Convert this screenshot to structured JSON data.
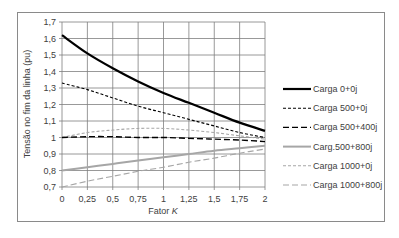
{
  "chart_data": {
    "type": "line",
    "title": "",
    "xlabel": "Fator K",
    "ylabel": "Tensão no fim da linha (pu)",
    "xlim": [
      0,
      2
    ],
    "ylim": [
      0.7,
      1.7
    ],
    "grid": true,
    "legend_position": "right",
    "x_ticks": [
      "0",
      "0,25",
      "0,5",
      "0,75",
      "1",
      "1,25",
      "1,5",
      "1,75",
      "2"
    ],
    "y_ticks": [
      "0,7",
      "0,8",
      "0,9",
      "1",
      "1,1",
      "1,2",
      "1,3",
      "1,4",
      "1,5",
      "1,6",
      "1,7"
    ],
    "x": [
      0,
      0.25,
      0.5,
      0.75,
      1,
      1.25,
      1.5,
      1.75,
      2
    ],
    "series": [
      {
        "name": "Carga 0+0j",
        "values": [
          1.62,
          1.51,
          1.42,
          1.34,
          1.27,
          1.21,
          1.15,
          1.09,
          1.04
        ],
        "color": "#000000",
        "width": 2.2,
        "dash": ""
      },
      {
        "name": "Carga 500+0j",
        "values": [
          1.33,
          1.29,
          1.24,
          1.19,
          1.15,
          1.11,
          1.07,
          1.03,
          1.0
        ],
        "color": "#000000",
        "width": 1.1,
        "dash": "3,2"
      },
      {
        "name": "Carga 500+400j",
        "values": [
          1.0,
          1.005,
          1.005,
          1.0,
          1.0,
          0.995,
          0.99,
          0.985,
          0.975
        ],
        "color": "#000000",
        "width": 1.4,
        "dash": "6,3"
      },
      {
        "name": "Carg.500+800j",
        "values": [
          0.8,
          0.82,
          0.84,
          0.86,
          0.88,
          0.9,
          0.92,
          0.935,
          0.95
        ],
        "color": "#a6a6a6",
        "width": 2.0,
        "dash": ""
      },
      {
        "name": "Carga 1000+0j",
        "values": [
          1.0,
          1.03,
          1.045,
          1.055,
          1.055,
          1.045,
          1.03,
          1.01,
          0.99
        ],
        "color": "#a6a6a6",
        "width": 1.1,
        "dash": "3,2"
      },
      {
        "name": "Carga 1000+800j",
        "values": [
          0.7,
          0.735,
          0.765,
          0.795,
          0.82,
          0.85,
          0.875,
          0.905,
          0.93
        ],
        "color": "#a6a6a6",
        "width": 1.1,
        "dash": "6,3"
      }
    ]
  }
}
